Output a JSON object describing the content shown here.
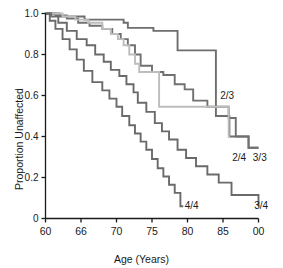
{
  "chart_data": {
    "type": "line",
    "subtype": "kaplan-meier-step",
    "title": "",
    "xlabel": "Age (Years)",
    "ylabel": "Proportion Unaffected",
    "xlim": [
      60,
      90
    ],
    "ylim": [
      0,
      1.0
    ],
    "grid": false,
    "legend": "inline-end-labels",
    "xticks": [
      60,
      65,
      70,
      75,
      80,
      85,
      90
    ],
    "xticklabels": [
      "60",
      "66",
      "70",
      "75",
      "80",
      "85",
      "00"
    ],
    "yticks": [
      0,
      0.2,
      0.4,
      0.6,
      0.8,
      1.0
    ],
    "yticklabels": [
      "0",
      "0.2",
      "0.4",
      "0.6",
      "0.8",
      "1.0"
    ],
    "series": [
      {
        "name": "2/3",
        "label": "2/3",
        "color": "#6e6e6e",
        "label_x": 84.6,
        "label_y": 0.6,
        "points": [
          [
            60,
            1.0
          ],
          [
            62,
            1.0
          ],
          [
            62,
            0.985
          ],
          [
            65.5,
            0.985
          ],
          [
            65.5,
            0.97
          ],
          [
            71.0,
            0.97
          ],
          [
            71.0,
            0.955
          ],
          [
            71.6,
            0.955
          ],
          [
            71.6,
            0.93
          ],
          [
            75.2,
            0.93
          ],
          [
            75.2,
            0.915
          ],
          [
            78.6,
            0.915
          ],
          [
            78.6,
            0.82
          ],
          [
            84.0,
            0.82
          ],
          [
            84.0,
            0.5
          ],
          [
            85.9,
            0.5
          ],
          [
            85.9,
            0.4
          ],
          [
            88.6,
            0.4
          ],
          [
            88.6,
            0.345
          ],
          [
            90,
            0.345
          ]
        ]
      },
      {
        "name": "3/3",
        "label": "3/3",
        "color": "#707070",
        "label_x": 89.2,
        "label_y": 0.3,
        "points": [
          [
            60,
            1.0
          ],
          [
            61.4,
            1.0
          ],
          [
            61.4,
            0.99
          ],
          [
            63.0,
            0.99
          ],
          [
            63.0,
            0.975
          ],
          [
            64.6,
            0.975
          ],
          [
            64.6,
            0.955
          ],
          [
            66.2,
            0.955
          ],
          [
            66.2,
            0.94
          ],
          [
            68.0,
            0.94
          ],
          [
            68.0,
            0.925
          ],
          [
            69.4,
            0.925
          ],
          [
            69.4,
            0.9
          ],
          [
            70.6,
            0.9
          ],
          [
            70.6,
            0.875
          ],
          [
            71.6,
            0.875
          ],
          [
            71.6,
            0.845
          ],
          [
            72.6,
            0.845
          ],
          [
            72.6,
            0.8
          ],
          [
            73.4,
            0.8
          ],
          [
            73.4,
            0.745
          ],
          [
            75.0,
            0.745
          ],
          [
            75.0,
            0.715
          ],
          [
            76.6,
            0.715
          ],
          [
            76.6,
            0.7
          ],
          [
            78.2,
            0.7
          ],
          [
            78.2,
            0.655
          ],
          [
            79.6,
            0.655
          ],
          [
            79.6,
            0.63
          ],
          [
            80.8,
            0.63
          ],
          [
            80.8,
            0.575
          ],
          [
            82.8,
            0.575
          ],
          [
            82.8,
            0.545
          ],
          [
            85.8,
            0.545
          ],
          [
            85.8,
            0.49
          ],
          [
            86.8,
            0.49
          ],
          [
            86.8,
            0.4
          ],
          [
            88.6,
            0.4
          ],
          [
            88.6,
            0.345
          ],
          [
            90,
            0.345
          ]
        ]
      },
      {
        "name": "2/4",
        "label": "2/4",
        "color": "#bdbdbd",
        "label_x": 86.3,
        "label_y": 0.3,
        "points": [
          [
            60,
            1.0
          ],
          [
            62.4,
            1.0
          ],
          [
            62.4,
            0.985
          ],
          [
            64.2,
            0.985
          ],
          [
            64.2,
            0.97
          ],
          [
            66.0,
            0.97
          ],
          [
            66.0,
            0.955
          ],
          [
            68.0,
            0.955
          ],
          [
            68.0,
            0.925
          ],
          [
            69.2,
            0.925
          ],
          [
            69.2,
            0.9
          ],
          [
            70.2,
            0.9
          ],
          [
            70.2,
            0.875
          ],
          [
            71.0,
            0.875
          ],
          [
            71.0,
            0.845
          ],
          [
            71.8,
            0.845
          ],
          [
            71.8,
            0.8
          ],
          [
            72.6,
            0.8
          ],
          [
            72.6,
            0.755
          ],
          [
            73.2,
            0.755
          ],
          [
            73.2,
            0.715
          ],
          [
            76.0,
            0.715
          ],
          [
            76.0,
            0.545
          ],
          [
            85.8,
            0.545
          ],
          [
            85.8,
            0.4
          ],
          [
            86.0,
            0.4
          ]
        ]
      },
      {
        "name": "3/4",
        "label": "3/4",
        "color": "#6a6a6a",
        "label_x": 89.4,
        "label_y": 0.065,
        "points": [
          [
            60,
            1.0
          ],
          [
            60.8,
            1.0
          ],
          [
            60.8,
            0.985
          ],
          [
            61.8,
            0.985
          ],
          [
            61.8,
            0.955
          ],
          [
            63.0,
            0.955
          ],
          [
            63.0,
            0.915
          ],
          [
            64.4,
            0.915
          ],
          [
            64.4,
            0.875
          ],
          [
            65.8,
            0.875
          ],
          [
            65.8,
            0.845
          ],
          [
            67.0,
            0.845
          ],
          [
            67.0,
            0.8
          ],
          [
            68.2,
            0.8
          ],
          [
            68.2,
            0.765
          ],
          [
            69.2,
            0.765
          ],
          [
            69.2,
            0.725
          ],
          [
            70.4,
            0.725
          ],
          [
            70.4,
            0.695
          ],
          [
            71.4,
            0.695
          ],
          [
            71.4,
            0.655
          ],
          [
            72.4,
            0.655
          ],
          [
            72.4,
            0.615
          ],
          [
            73.0,
            0.615
          ],
          [
            73.0,
            0.565
          ],
          [
            74.2,
            0.565
          ],
          [
            74.2,
            0.52
          ],
          [
            75.4,
            0.52
          ],
          [
            75.4,
            0.465
          ],
          [
            76.4,
            0.465
          ],
          [
            76.4,
            0.425
          ],
          [
            77.4,
            0.425
          ],
          [
            77.4,
            0.385
          ],
          [
            78.6,
            0.385
          ],
          [
            78.6,
            0.335
          ],
          [
            79.8,
            0.335
          ],
          [
            79.8,
            0.295
          ],
          [
            81.2,
            0.295
          ],
          [
            81.2,
            0.255
          ],
          [
            82.8,
            0.255
          ],
          [
            82.8,
            0.215
          ],
          [
            84.4,
            0.215
          ],
          [
            84.4,
            0.175
          ],
          [
            86.2,
            0.175
          ],
          [
            86.2,
            0.115
          ],
          [
            90,
            0.115
          ],
          [
            90,
            0.06
          ],
          [
            90,
            0.06
          ]
        ]
      },
      {
        "name": "4/4",
        "label": "4/4",
        "color": "#6a6a6a",
        "label_x": 79.6,
        "label_y": 0.065,
        "points": [
          [
            60,
            1.0
          ],
          [
            60.6,
            1.0
          ],
          [
            60.6,
            0.965
          ],
          [
            61.4,
            0.965
          ],
          [
            61.4,
            0.925
          ],
          [
            62.4,
            0.925
          ],
          [
            62.4,
            0.875
          ],
          [
            63.4,
            0.875
          ],
          [
            63.4,
            0.825
          ],
          [
            64.4,
            0.825
          ],
          [
            64.4,
            0.775
          ],
          [
            65.4,
            0.775
          ],
          [
            65.4,
            0.72
          ],
          [
            66.6,
            0.72
          ],
          [
            66.6,
            0.665
          ],
          [
            68.0,
            0.665
          ],
          [
            68.0,
            0.625
          ],
          [
            69.0,
            0.625
          ],
          [
            69.0,
            0.585
          ],
          [
            70.0,
            0.585
          ],
          [
            70.0,
            0.545
          ],
          [
            70.8,
            0.545
          ],
          [
            70.8,
            0.5
          ],
          [
            71.8,
            0.5
          ],
          [
            71.8,
            0.455
          ],
          [
            72.6,
            0.455
          ],
          [
            72.6,
            0.415
          ],
          [
            73.4,
            0.415
          ],
          [
            73.4,
            0.375
          ],
          [
            74.2,
            0.375
          ],
          [
            74.2,
            0.335
          ],
          [
            75.0,
            0.335
          ],
          [
            75.0,
            0.29
          ],
          [
            75.8,
            0.29
          ],
          [
            75.8,
            0.245
          ],
          [
            76.6,
            0.245
          ],
          [
            76.6,
            0.205
          ],
          [
            77.4,
            0.205
          ],
          [
            77.4,
            0.165
          ],
          [
            78.2,
            0.165
          ],
          [
            78.2,
            0.125
          ],
          [
            79.0,
            0.125
          ],
          [
            79.0,
            0.06
          ],
          [
            79.4,
            0.06
          ]
        ]
      }
    ]
  }
}
